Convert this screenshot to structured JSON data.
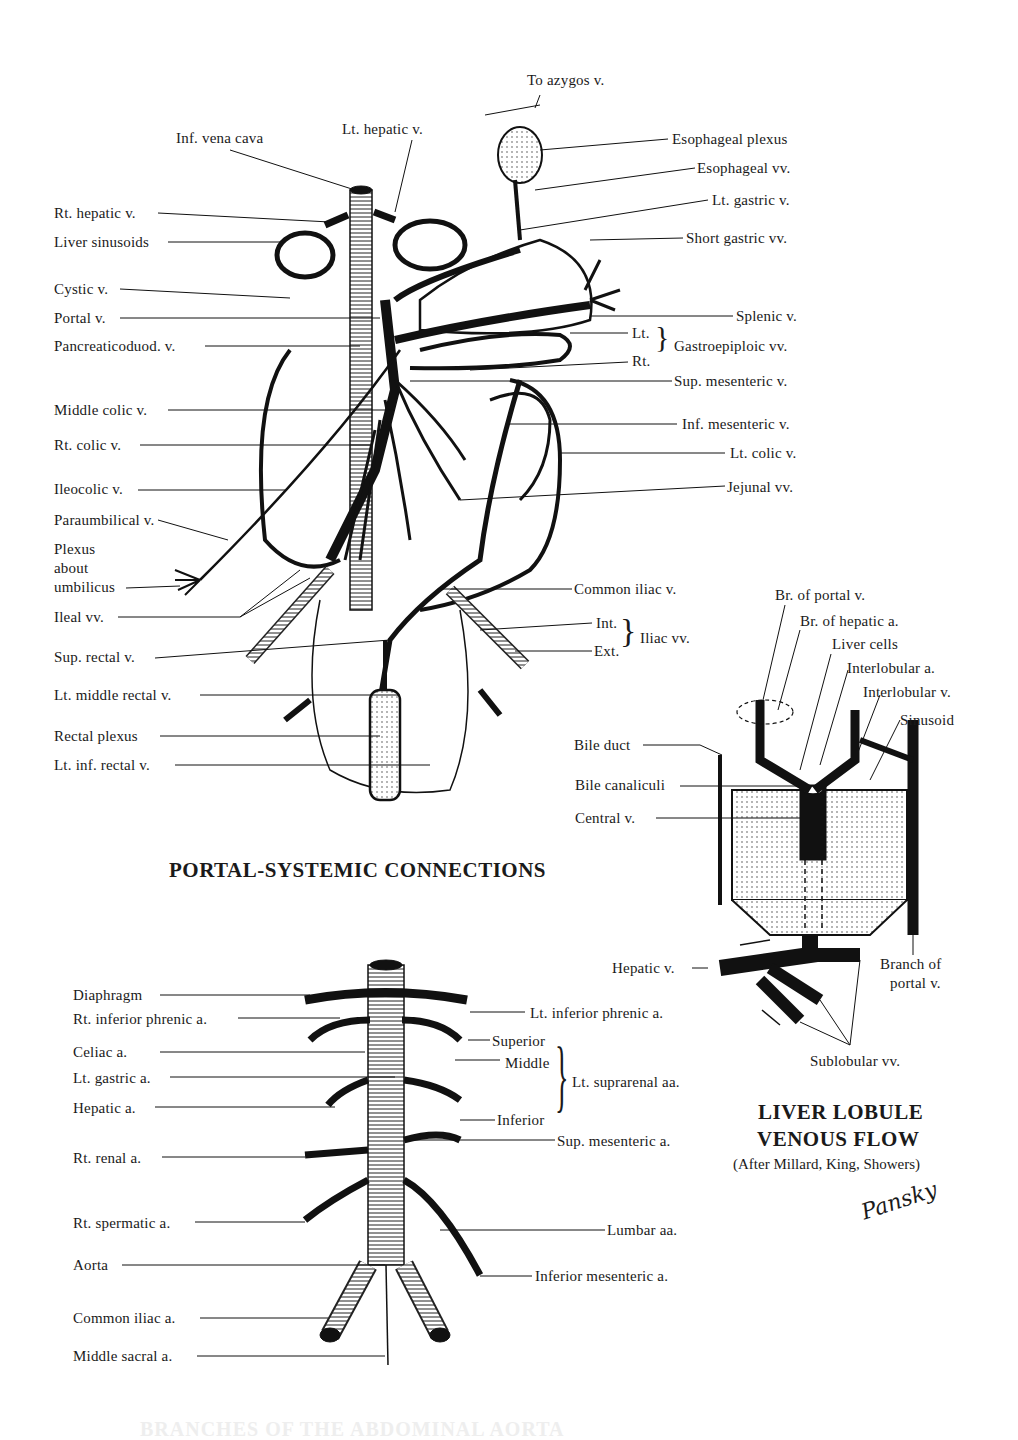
{
  "portal_systemic": {
    "title": "PORTAL-SYSTEMIC CONNECTIONS",
    "labels_left": [
      {
        "text": "Inf. vena cava"
      },
      {
        "text": "Lt. hepatic v."
      },
      {
        "text": "Rt. hepatic v."
      },
      {
        "text": "Liver sinusoids"
      },
      {
        "text": "Cystic v."
      },
      {
        "text": "Portal v."
      },
      {
        "text": "Pancreaticoduod. v."
      },
      {
        "text": "Middle colic v."
      },
      {
        "text": "Rt. colic v."
      },
      {
        "text": "Ileocolic v."
      },
      {
        "text": "Paraumbilical v."
      },
      {
        "text": "Plexus"
      },
      {
        "text": "about"
      },
      {
        "text": "umbilicus"
      },
      {
        "text": "Ileal vv."
      },
      {
        "text": "Sup. rectal v."
      },
      {
        "text": "Lt. middle rectal v."
      },
      {
        "text": "Rectal  plexus"
      },
      {
        "text": "Lt. inf. rectal v."
      }
    ],
    "labels_right": [
      {
        "text": "To azygos v."
      },
      {
        "text": "Esophageal plexus"
      },
      {
        "text": "Esophageal vv."
      },
      {
        "text": "Lt. gastric v."
      },
      {
        "text": "Short gastric vv."
      },
      {
        "text": "Splenic v."
      },
      {
        "text": "Lt."
      },
      {
        "text": "Rt."
      },
      {
        "text": "Gastroepiploic vv."
      },
      {
        "text": "Sup. mesenteric v."
      },
      {
        "text": "Inf. mesenteric v."
      },
      {
        "text": "Lt. colic v."
      },
      {
        "text": "Jejunal  vv."
      },
      {
        "text": "Common iliac v."
      },
      {
        "text": "Int."
      },
      {
        "text": "Ext."
      },
      {
        "text": "Iliac vv."
      }
    ]
  },
  "liver_lobule": {
    "title_line1": "LIVER LOBULE",
    "title_line2": "VENOUS FLOW",
    "credit": "(After Millard, King, Showers)",
    "signature": "Pansky",
    "labels": [
      {
        "text": "Br. of portal v."
      },
      {
        "text": "Br. of hepatic  a."
      },
      {
        "text": "Liver cells"
      },
      {
        "text": "Interlobular a."
      },
      {
        "text": "Interlobular v."
      },
      {
        "text": "Sinusoid"
      },
      {
        "text": "Bile duct"
      },
      {
        "text": "Bile canaliculi"
      },
      {
        "text": "Central v."
      },
      {
        "text": "Hepatic v."
      },
      {
        "text": "Branch of"
      },
      {
        "text": "portal v."
      },
      {
        "text": "Sublobular vv."
      }
    ]
  },
  "aorta": {
    "labels_left": [
      {
        "text": "Diaphragm"
      },
      {
        "text": "Rt. inferior phrenic a."
      },
      {
        "text": "Celiac a."
      },
      {
        "text": "Lt. gastric a."
      },
      {
        "text": "Hepatic a."
      },
      {
        "text": "Rt. renal a."
      },
      {
        "text": "Rt. spermatic a."
      },
      {
        "text": "Aorta"
      },
      {
        "text": "Common iliac a."
      },
      {
        "text": "Middle sacral a."
      }
    ],
    "labels_right": [
      {
        "text": "Lt. inferior phrenic a."
      },
      {
        "text": "Superior"
      },
      {
        "text": "Middle"
      },
      {
        "text": "Lt. suprarenal aa."
      },
      {
        "text": "Inferior"
      },
      {
        "text": "Sup. mesenteric a."
      },
      {
        "text": "Lumbar aa."
      },
      {
        "text": "Inferior mesenteric a."
      }
    ],
    "cutoff_title": "BRANCHES OF THE ABDOMINAL AORTA"
  }
}
